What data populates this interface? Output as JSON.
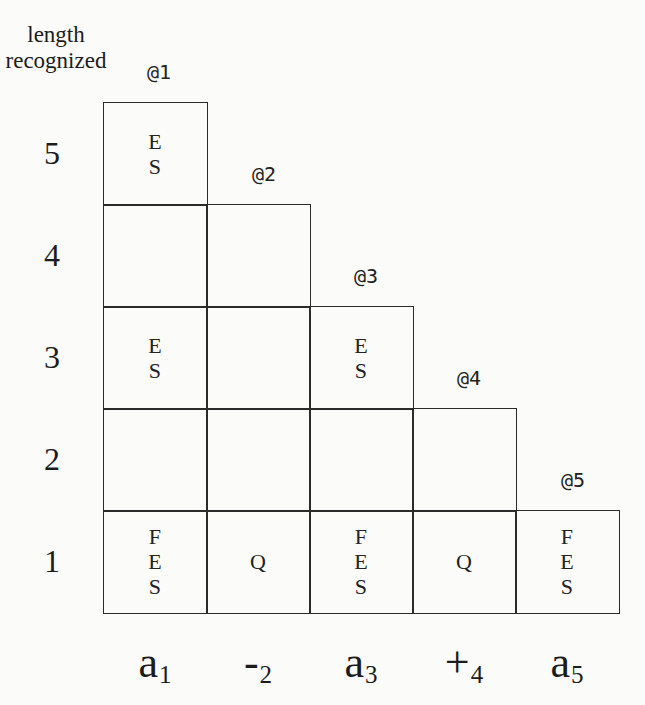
{
  "y_axis": {
    "title_lines": [
      "length",
      "recognized"
    ],
    "row_labels": [
      "5",
      "4",
      "3",
      "2",
      "1"
    ]
  },
  "markers": {
    "labels": [
      "@1",
      "@2",
      "@3",
      "@4",
      "@5"
    ]
  },
  "grid": {
    "rows": [
      {
        "length": "5",
        "cells": [
          "E\nS"
        ]
      },
      {
        "length": "4",
        "cells": [
          "",
          ""
        ]
      },
      {
        "length": "3",
        "cells": [
          "E\nS",
          "",
          "E\nS"
        ]
      },
      {
        "length": "2",
        "cells": [
          "",
          "",
          "",
          ""
        ]
      },
      {
        "length": "1",
        "cells": [
          "F\nE\nS",
          "Q",
          "F\nE\nS",
          "Q",
          "F\nE\nS"
        ]
      }
    ]
  },
  "x_axis": {
    "labels": [
      {
        "symbol": "a",
        "subscript": "1"
      },
      {
        "symbol": "-",
        "subscript": "2"
      },
      {
        "symbol": "a",
        "subscript": "3"
      },
      {
        "symbol": "+",
        "subscript": "4"
      },
      {
        "symbol": "a",
        "subscript": "5"
      }
    ]
  }
}
